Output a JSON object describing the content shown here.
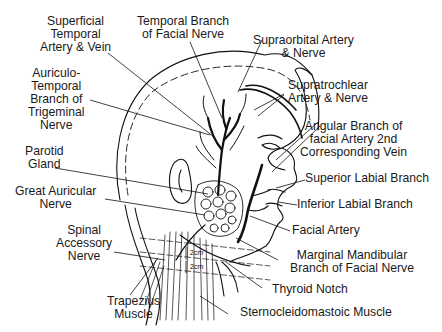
{
  "diagram": {
    "labels": {
      "superficial_temporal": [
        "Superficial",
        "Temporal",
        "Artery & Vein"
      ],
      "temporal_branch_facial": [
        "Temporal Branch",
        "of Facial Nerve"
      ],
      "supraorbital": [
        "Supraorbital Artery",
        "& Nerve"
      ],
      "supratrochlear": [
        "Supratrochlear",
        "Artery & Nerve"
      ],
      "auriculo_temporal": [
        "Auriculo-",
        "Temporal",
        "Branch of",
        "Trigeminal",
        "Nerve"
      ],
      "angular_branch": [
        "Angular Branch of",
        "facial Artery 2nd",
        "Corresponding Vein"
      ],
      "parotid": [
        "Parotid",
        "Gland"
      ],
      "superior_labial": [
        "Superior Labial Branch"
      ],
      "great_auricular": [
        "Great Auricular",
        "Nerve"
      ],
      "inferior_labial": [
        "Inferior Labial Branch"
      ],
      "spinal_accessory": [
        "Spinal",
        "Accessory",
        "Nerve"
      ],
      "facial_artery": [
        "Facial Artery"
      ],
      "marginal_mandibular": [
        "Marginal Mandibular",
        "Branch of Facial Nerve"
      ],
      "thyroid_notch": [
        "Thyroid Notch"
      ],
      "trapezius": [
        "Trapezius",
        "Muscle"
      ],
      "sternocleidomastoid": [
        "Sternocleidomastoic Muscle"
      ]
    },
    "measurements": [
      "2cm",
      "2cm"
    ]
  }
}
